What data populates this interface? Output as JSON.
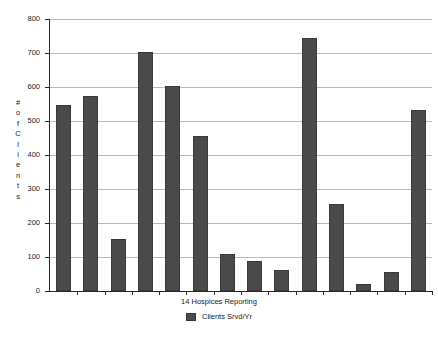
{
  "chart_data": {
    "type": "bar",
    "title": "",
    "xlabel": "14 Hospices Reporting",
    "ylabel": "# of Clients",
    "ylim": [
      0,
      800
    ],
    "ytick_values": [
      0,
      100,
      200,
      300,
      400,
      500,
      600,
      700,
      800
    ],
    "ytick_labels": [
      "0",
      "100",
      "200",
      "300",
      "400",
      "500",
      "600",
      "700",
      "800"
    ],
    "grid": true,
    "legend_position": "bottom",
    "series": [
      {
        "name": "Clients Srvd/Yr",
        "color": "#4a4a4a",
        "values": [
          547,
          573,
          152,
          703,
          604,
          457,
          110,
          88,
          62,
          744,
          255,
          20,
          55,
          532
        ]
      }
    ],
    "categories": [
      "1",
      "2",
      "3",
      "4",
      "5",
      "6",
      "7",
      "8",
      "9",
      "10",
      "11",
      "12",
      "13",
      "14"
    ],
    "bar_count": 14
  },
  "axis": {
    "y_title_chars": [
      "#",
      "o",
      "f",
      "C",
      "l",
      "i",
      "e",
      "n",
      "t",
      "s"
    ]
  },
  "legend": {
    "swatch_name": "series-color-swatch",
    "label": "Clients Srvd/Yr"
  }
}
